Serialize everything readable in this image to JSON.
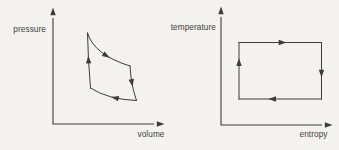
{
  "canvas": {
    "width": 339,
    "height": 150,
    "background": "#f3f2ef",
    "ink": "#3d3c3a",
    "label_color": "#3f3e3c"
  },
  "diagrams": [
    {
      "id": "pv",
      "y_axis_label": "pressure",
      "x_axis_label": "volume",
      "cycle_direction": "clockwise",
      "axes": {
        "origin": [
          53,
          124
        ],
        "x_end": [
          160,
          124
        ],
        "y_end": [
          53,
          12
        ]
      },
      "labels": {
        "y": {
          "x": 46,
          "y": 32
        },
        "x": {
          "x": 164.5,
          "y": 137
        }
      },
      "segments": [
        {
          "name": "upper-isotherm",
          "from": [
            87.5,
            33
          ],
          "ctrl": [
            94,
            55
          ],
          "to": [
            130,
            66
          ],
          "arrow_t": 0.6
        },
        {
          "name": "right-adiabat",
          "from": [
            130,
            66
          ],
          "ctrl": [
            131,
            85
          ],
          "to": [
            136.5,
            100.5
          ],
          "arrow_t": 0.45
        },
        {
          "name": "lower-isotherm",
          "from": [
            136.5,
            100.5
          ],
          "ctrl": [
            108,
            99.5
          ],
          "to": [
            90.5,
            88
          ],
          "arrow_t": 0.4
        },
        {
          "name": "left-adiabat",
          "from": [
            90.5,
            88
          ],
          "ctrl": [
            88,
            60
          ],
          "to": [
            87.5,
            33
          ],
          "arrow_t": 0.5
        }
      ]
    },
    {
      "id": "ts",
      "y_axis_label": "temperature",
      "x_axis_label": "entropy",
      "cycle_direction": "clockwise",
      "axes": {
        "origin": [
          221,
          125
        ],
        "x_end": [
          328,
          125
        ],
        "y_end": [
          221,
          11
        ]
      },
      "labels": {
        "y": {
          "x": 216,
          "y": 30
        },
        "x": {
          "x": 327.5,
          "y": 137
        }
      },
      "segments": [
        {
          "name": "top-isotherm",
          "from": [
            239,
            42.5
          ],
          "to": [
            321.5,
            42.5
          ],
          "arrow_t": 0.52
        },
        {
          "name": "right-isentrope",
          "from": [
            321.5,
            42.5
          ],
          "to": [
            321.5,
            99
          ],
          "arrow_t": 0.54
        },
        {
          "name": "bottom-isotherm",
          "from": [
            321.5,
            99
          ],
          "to": [
            239,
            99
          ],
          "arrow_t": 0.59
        },
        {
          "name": "left-isentrope",
          "from": [
            239,
            99
          ],
          "to": [
            239,
            42.5
          ],
          "arrow_t": 0.64
        }
      ]
    }
  ]
}
